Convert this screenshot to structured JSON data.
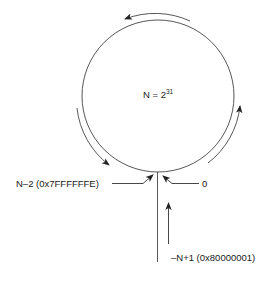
{
  "diagram": {
    "type": "circular-wraparound",
    "center_label": {
      "base": "N = 2",
      "exponent": "31"
    },
    "labels": {
      "n_minus_2": "N–2 (0x7FFFFFFE)",
      "zero": "0",
      "neg_n_plus_1": "–N+1 (0x80000001)"
    },
    "colors": {
      "stroke": "#333333",
      "text": "#1a1a1a",
      "background": "#ffffff"
    },
    "arrows": [
      {
        "name": "top-arc-arrow",
        "direction": "counterclockwise"
      },
      {
        "name": "left-arc-arrow",
        "direction": "counterclockwise"
      },
      {
        "name": "right-arc-arrow",
        "direction": "counterclockwise"
      },
      {
        "name": "n-minus-2-pointer",
        "direction": "right"
      },
      {
        "name": "zero-pointer",
        "direction": "left"
      },
      {
        "name": "neg-n-plus-1-pointer",
        "direction": "up"
      }
    ]
  }
}
